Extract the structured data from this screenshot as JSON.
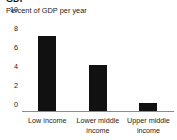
{
  "chart_data": {
    "type": "bar",
    "title": "GDP",
    "subtitle": "Percent of GDP per year",
    "categories": [
      "Low income",
      "Lower middle income",
      "Upper middle income"
    ],
    "values": [
      8,
      5,
      1
    ],
    "series": [
      {
        "name": "Percent of GDP per year",
        "values": [
          8,
          5,
          1
        ]
      }
    ],
    "xlabel": "",
    "ylabel": "",
    "ylim": [
      0,
      10
    ],
    "yticks": [
      0,
      2,
      4,
      6,
      8,
      10
    ],
    "ytick_labels": [
      "0",
      "2",
      "4",
      "6",
      "8",
      "10"
    ],
    "grid": false,
    "legend": false,
    "bar_color": "#111111",
    "axis_color": "#8b8b8b",
    "background": "#ffffff"
  }
}
